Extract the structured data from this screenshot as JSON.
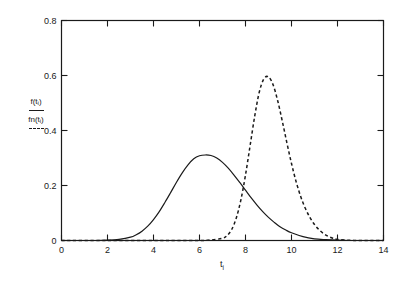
{
  "chart_data": {
    "type": "line",
    "title": "",
    "subtitle": "",
    "xlabel": "t_i",
    "xlabel_base": "t",
    "xlabel_sub": "i",
    "ylabel": "",
    "xlim": [
      0,
      14
    ],
    "ylim": [
      0,
      0.8
    ],
    "xticks": [
      "0",
      "2",
      "4",
      "6",
      "8",
      "10",
      "12",
      "14"
    ],
    "xtick_values": [
      0,
      2,
      4,
      6,
      8,
      10,
      12,
      14
    ],
    "yticks": [
      "0",
      "0.2",
      "0.4",
      "0.6",
      "0.8"
    ],
    "ytick_values": [
      0,
      0.2,
      0.4,
      0.6,
      0.8
    ],
    "grid": false,
    "legend_position": "y-axis-label",
    "series": [
      {
        "name": "f(t_i)",
        "name_base": "f(t",
        "name_sub": "i",
        "name_tail": ")",
        "style": "solid",
        "color": "#1a1a1a",
        "peak_x": 6.8,
        "peak_y": 0.31,
        "x": [
          0.0,
          0.5,
          1.0,
          1.5,
          2.0,
          2.5,
          3.0,
          3.25,
          3.5,
          3.75,
          4.0,
          4.25,
          4.5,
          4.75,
          5.0,
          5.25,
          5.5,
          5.75,
          6.0,
          6.25,
          6.5,
          6.75,
          7.0,
          7.25,
          7.5,
          7.75,
          8.0,
          8.25,
          8.5,
          8.75,
          9.0,
          9.25,
          9.5,
          9.75,
          10.0,
          10.5,
          11.0,
          11.5,
          12.0,
          12.5,
          13.0,
          13.5,
          14.0
        ],
        "y": [
          0.0,
          0.0,
          0.0,
          0.0,
          0.001,
          0.004,
          0.012,
          0.021,
          0.034,
          0.052,
          0.076,
          0.105,
          0.139,
          0.175,
          0.212,
          0.246,
          0.275,
          0.297,
          0.308,
          0.311,
          0.309,
          0.3,
          0.284,
          0.263,
          0.238,
          0.211,
          0.183,
          0.155,
          0.129,
          0.105,
          0.084,
          0.066,
          0.05,
          0.038,
          0.028,
          0.014,
          0.006,
          0.003,
          0.001,
          0.0,
          0.0,
          0.0,
          0.0
        ]
      },
      {
        "name": "fn(t_i)",
        "name_base": "fn(t",
        "name_sub": "i",
        "name_tail": ")",
        "style": "dashed",
        "color": "#1a1a1a",
        "peak_x": 8.9,
        "peak_y": 0.595,
        "x": [
          0.0,
          2.0,
          4.0,
          5.0,
          6.0,
          6.5,
          7.0,
          7.2,
          7.4,
          7.6,
          7.8,
          8.0,
          8.2,
          8.4,
          8.6,
          8.8,
          9.0,
          9.2,
          9.4,
          9.6,
          9.8,
          10.0,
          10.2,
          10.4,
          10.6,
          10.8,
          11.0,
          11.2,
          11.4,
          11.6,
          11.8,
          12.0,
          12.5,
          13.0,
          13.5,
          14.0
        ],
        "y": [
          0.0,
          0.0,
          0.0,
          0.0,
          0.0,
          0.002,
          0.008,
          0.018,
          0.04,
          0.082,
          0.148,
          0.238,
          0.345,
          0.452,
          0.54,
          0.588,
          0.595,
          0.566,
          0.508,
          0.434,
          0.355,
          0.28,
          0.214,
          0.16,
          0.117,
          0.084,
          0.058,
          0.039,
          0.025,
          0.015,
          0.008,
          0.004,
          0.001,
          0.0,
          0.0,
          0.0
        ]
      }
    ]
  },
  "plot": {
    "frame_color": "#1a1a1a",
    "background": "#ffffff"
  }
}
